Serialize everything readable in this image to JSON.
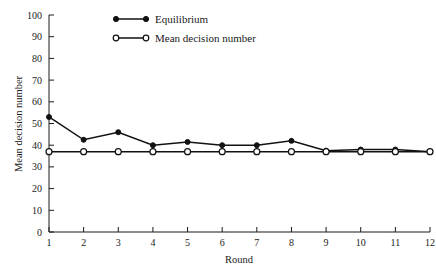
{
  "chart_data": {
    "type": "line",
    "title": "",
    "xlabel": "Round",
    "ylabel": "Mean decision number",
    "x": [
      1,
      2,
      3,
      4,
      5,
      6,
      7,
      8,
      9,
      10,
      11,
      12
    ],
    "xtick_labels": [
      "1",
      "2",
      "3",
      "4",
      "5",
      "6",
      "7",
      "8",
      "9",
      "10",
      "11",
      "12"
    ],
    "ytick_labels": [
      "0",
      "10",
      "20",
      "30",
      "40",
      "50",
      "60",
      "70",
      "80",
      "90",
      "100"
    ],
    "yticks": [
      0,
      10,
      20,
      30,
      40,
      50,
      60,
      70,
      80,
      90,
      100
    ],
    "xlim": [
      1,
      12
    ],
    "ylim": [
      0,
      100
    ],
    "grid": false,
    "legend_position": "top-left-inside",
    "series": [
      {
        "name": "Equilibrium",
        "marker": "filled-circle",
        "values": [
          53,
          42.5,
          46,
          40,
          41.5,
          40,
          40,
          42,
          37.5,
          38,
          38,
          37
        ]
      },
      {
        "name": "Mean decision number",
        "marker": "open-circle",
        "values": [
          37,
          37,
          37,
          37,
          37,
          37,
          37,
          37,
          37,
          37,
          37,
          37
        ]
      }
    ]
  },
  "legend": {
    "items": [
      {
        "label": "Equilibrium",
        "marker": "filled-circle"
      },
      {
        "label": "Mean decision number",
        "marker": "open-circle"
      }
    ]
  },
  "axes": {
    "x_title": "Round",
    "y_title": "Mean decision number"
  }
}
